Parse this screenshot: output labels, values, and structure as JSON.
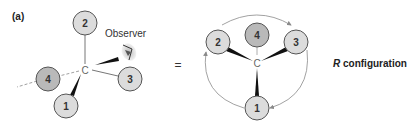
{
  "panel_label": "(a)",
  "equals_sign": "=",
  "observer_label": "Observer",
  "left_diagram": {
    "center_label": "C",
    "substituents": [
      {
        "priority": "1",
        "position": "lower-left wedge"
      },
      {
        "priority": "2",
        "position": "top"
      },
      {
        "priority": "3",
        "position": "right"
      },
      {
        "priority": "4",
        "position": "left dashed"
      }
    ]
  },
  "right_diagram": {
    "center_label": "C",
    "substituents": [
      {
        "priority": "1",
        "position": "bottom"
      },
      {
        "priority": "2",
        "position": "upper-left"
      },
      {
        "priority": "3",
        "position": "upper-right"
      },
      {
        "priority": "4",
        "position": "top back"
      }
    ],
    "rotation": "clockwise"
  },
  "configuration_label": {
    "letter": "R",
    "text": " configuration"
  },
  "colors": {
    "circle_fill": "#dcdcdc",
    "circle_low_priority_fill": "#b9b9b9",
    "circle_stroke": "#555555",
    "bond": "#777777",
    "wedge": "#111111",
    "arrow": "#8a8a8a",
    "text": "#222222"
  }
}
